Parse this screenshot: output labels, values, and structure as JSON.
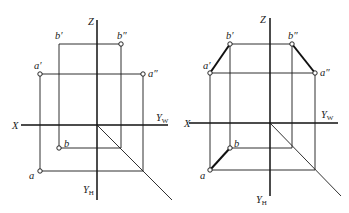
{
  "figure": {
    "left": {
      "axes": {
        "x": "X",
        "z": "Z",
        "yw": "Y",
        "yw_sub": "W",
        "yh": "Y",
        "yh_sub": "H"
      },
      "points": {
        "a_prime": "a′",
        "b_prime": "b′",
        "a_dprime": "a″",
        "b_dprime": "b″",
        "a": "a",
        "b": "b"
      }
    },
    "right": {
      "axes": {
        "x": "X",
        "z": "Z",
        "yw": "Y",
        "yw_sub": "W",
        "yh": "Y",
        "yh_sub": "H"
      },
      "points": {
        "a_prime": "a′",
        "b_prime": "b′",
        "a_dprime": "a″",
        "b_dprime": "b″",
        "a": "a",
        "b": "b"
      }
    }
  }
}
